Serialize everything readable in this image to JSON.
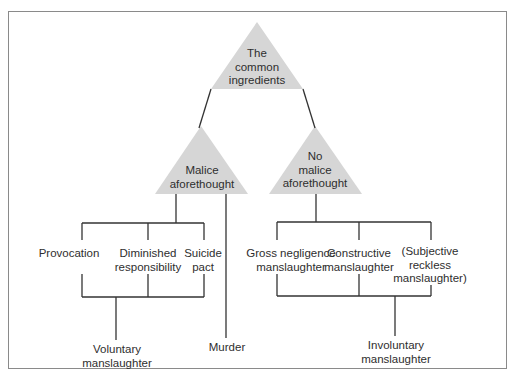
{
  "diagram": {
    "type": "tree",
    "colors": {
      "triangle_fill": "#d6d6d6",
      "line": "#333333",
      "frame": "#8a8a8a",
      "text": "#2e2e2e"
    },
    "root": {
      "label_lines": [
        "The",
        "common",
        "ingredients"
      ]
    },
    "branches": {
      "left": {
        "label_lines": [
          "Malice",
          "aforethought"
        ],
        "categories": [
          {
            "label_lines": [
              "Provocation"
            ]
          },
          {
            "label_lines": [
              "Diminished",
              "responsibility"
            ]
          },
          {
            "label_lines": [
              "Suicide",
              "pact"
            ]
          }
        ],
        "group_result": {
          "label_lines": [
            "Voluntary",
            "manslaughter"
          ]
        },
        "direct_result": {
          "label_lines": [
            "Murder"
          ]
        }
      },
      "right": {
        "label_lines": [
          "No",
          "malice",
          "aforethought"
        ],
        "categories": [
          {
            "label_lines": [
              "Gross negligence",
              "manslaughter"
            ]
          },
          {
            "label_lines": [
              "Constructive",
              "manslaughter"
            ]
          },
          {
            "label_lines": [
              "(Subjective",
              "reckless",
              "manslaughter)"
            ]
          }
        ],
        "group_result": {
          "label_lines": [
            "Involuntary",
            "manslaughter"
          ]
        }
      }
    }
  }
}
